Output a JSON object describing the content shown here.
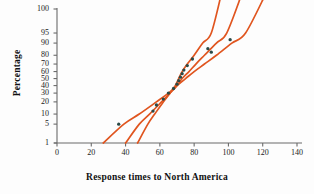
{
  "chart_data": {
    "type": "scatter",
    "title": "",
    "subtitle": "",
    "xlabel": "Response times to North America",
    "ylabel": "Percentage",
    "grid": false,
    "legend": null,
    "scale_note": "normal probability plot: y-axis uses a probit (normal) scale",
    "xlim": [
      0,
      140
    ],
    "xticks": [
      0,
      20,
      40,
      60,
      80,
      100,
      120,
      140
    ],
    "yticks": [
      1,
      5,
      10,
      20,
      30,
      40,
      50,
      60,
      70,
      80,
      90,
      95,
      100
    ],
    "ytick_labels": [
      "1",
      "5",
      "10",
      "20",
      "30",
      "40",
      "50",
      "60",
      "70",
      "80",
      "90",
      "95",
      "100"
    ],
    "point_color": "#2b4a47",
    "band_color": "#E0551F",
    "axis_color": "#6b6b6b",
    "series": [
      {
        "name": "Response times",
        "marker": "filled-circle",
        "points": [
          {
            "x": 36,
            "y": 5
          },
          {
            "x": 56,
            "y": 12
          },
          {
            "x": 58,
            "y": 17
          },
          {
            "x": 62,
            "y": 23
          },
          {
            "x": 65,
            "y": 30
          },
          {
            "x": 68,
            "y": 36
          },
          {
            "x": 70,
            "y": 42
          },
          {
            "x": 71,
            "y": 47
          },
          {
            "x": 72,
            "y": 52
          },
          {
            "x": 73,
            "y": 57
          },
          {
            "x": 74,
            "y": 62
          },
          {
            "x": 76,
            "y": 68
          },
          {
            "x": 79,
            "y": 76
          },
          {
            "x": 88,
            "y": 86
          },
          {
            "x": 90,
            "y": 83
          },
          {
            "x": 101,
            "y": 92
          }
        ]
      }
    ],
    "bands": [
      {
        "name": "lower-confidence-band",
        "points": [
          {
            "x": 47,
            "y": 1
          },
          {
            "x": 53,
            "y": 5
          },
          {
            "x": 57,
            "y": 10
          },
          {
            "x": 62,
            "y": 20
          },
          {
            "x": 66,
            "y": 30
          },
          {
            "x": 69,
            "y": 40
          },
          {
            "x": 71,
            "y": 50
          },
          {
            "x": 73,
            "y": 60
          },
          {
            "x": 76,
            "y": 70
          },
          {
            "x": 80,
            "y": 80
          },
          {
            "x": 85,
            "y": 90
          },
          {
            "x": 90,
            "y": 95
          },
          {
            "x": 96,
            "y": 100
          }
        ]
      },
      {
        "name": "fit-line",
        "points": [
          {
            "x": 40,
            "y": 1
          },
          {
            "x": 48,
            "y": 5
          },
          {
            "x": 54,
            "y": 10
          },
          {
            "x": 61,
            "y": 20
          },
          {
            "x": 66,
            "y": 30
          },
          {
            "x": 70,
            "y": 40
          },
          {
            "x": 73,
            "y": 50
          },
          {
            "x": 77,
            "y": 60
          },
          {
            "x": 81,
            "y": 70
          },
          {
            "x": 86,
            "y": 80
          },
          {
            "x": 93,
            "y": 90
          },
          {
            "x": 99,
            "y": 95
          },
          {
            "x": 108,
            "y": 100
          }
        ]
      },
      {
        "name": "upper-confidence-band",
        "points": [
          {
            "x": 27,
            "y": 1
          },
          {
            "x": 39,
            "y": 5
          },
          {
            "x": 48,
            "y": 10
          },
          {
            "x": 58,
            "y": 20
          },
          {
            "x": 65,
            "y": 30
          },
          {
            "x": 70,
            "y": 40
          },
          {
            "x": 75,
            "y": 50
          },
          {
            "x": 80,
            "y": 60
          },
          {
            "x": 86,
            "y": 70
          },
          {
            "x": 93,
            "y": 80
          },
          {
            "x": 102,
            "y": 90
          },
          {
            "x": 110,
            "y": 95
          },
          {
            "x": 122,
            "y": 100
          }
        ]
      }
    ]
  }
}
